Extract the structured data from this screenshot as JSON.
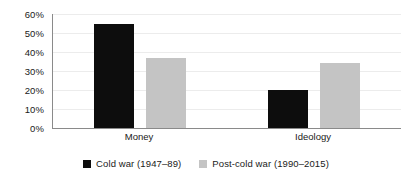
{
  "chart_data": {
    "type": "bar",
    "title": "",
    "subtitle": "",
    "xlabel": "",
    "ylabel": "",
    "categories": [
      "Money",
      "Ideology"
    ],
    "series": [
      {
        "name": "Cold war (1947–89)",
        "color": "#0d0d0d",
        "values": [
          55,
          20
        ]
      },
      {
        "name": "Post-cold war (1990–2015)",
        "color": "#c4c4c4",
        "values": [
          37,
          34
        ]
      }
    ],
    "ylim": [
      0,
      60
    ],
    "ytick_values": [
      0,
      10,
      20,
      30,
      40,
      50,
      60
    ],
    "ytick_labels": [
      "0%",
      "10%",
      "20%",
      "30%",
      "40%",
      "50%",
      "60%"
    ],
    "grid": true,
    "grid_axis": "y",
    "legend_position": "bottom",
    "value_suffix": "%"
  },
  "axis": {
    "y_labels": [
      "60%",
      "50%",
      "40%",
      "30%",
      "20%",
      "10%",
      "0%"
    ],
    "x_labels": [
      "Money",
      "Ideology"
    ]
  },
  "legend": {
    "items": [
      {
        "label": "Cold war (1947–89)",
        "swatch": "legend-swatch-black"
      },
      {
        "label": "Post-cold war (1990–2015)",
        "swatch": "legend-swatch-gray"
      }
    ]
  }
}
